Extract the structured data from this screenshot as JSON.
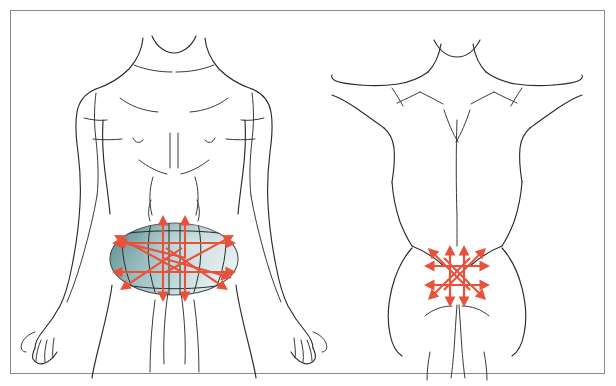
{
  "plate": {
    "title": "Abdominal and lumbosacral massage direction plate",
    "caption": "",
    "width": 616,
    "height": 386,
    "background_color": "#ffffff",
    "frame_color": "#8a8a8a",
    "frame_inset_px": 10
  },
  "colors": {
    "outline": "#2b2b2b",
    "detail": "#3a3a3a",
    "arrow": "#e8513a",
    "arrow_light": "#ef7a62",
    "ellipse_dark": "#5f8f92",
    "ellipse_mid": "#a8c8cb",
    "ellipse_light": "#e6f0f1",
    "ellipse_stroke": "#4a4a4a"
  },
  "panels": [
    {
      "id": "anterior-view",
      "name": "anterior-torso-view",
      "label": "",
      "view": "anterior",
      "region_highlight": {
        "shape": "ellipse",
        "center_x": 174,
        "center_y": 259,
        "radius_x": 64,
        "radius_y": 36,
        "fill_gradient": [
          "#5f8f92",
          "#a8c8cb",
          "#eef5f6"
        ],
        "stroke": "#4a4a4a"
      },
      "arrow_group": {
        "name": "abdominal-arrow-star",
        "center_x": 174,
        "center_y": 259,
        "arrow_count": 14,
        "color": "#e8513a",
        "arrows": [
          {
            "name": "arrow-up-left-vertical",
            "dir": "up",
            "x1": 163,
            "y1": 258,
            "x2": 163,
            "y2": 215
          },
          {
            "name": "arrow-up-right-vertical",
            "dir": "up",
            "x1": 185,
            "y1": 258,
            "x2": 185,
            "y2": 215
          },
          {
            "name": "arrow-down-left-vertical",
            "dir": "down",
            "x1": 163,
            "y1": 260,
            "x2": 163,
            "y2": 302
          },
          {
            "name": "arrow-down-right-vertical",
            "dir": "down",
            "x1": 185,
            "y1": 260,
            "x2": 185,
            "y2": 302
          },
          {
            "name": "arrow-left-upper",
            "dir": "left",
            "x1": 176,
            "y1": 243,
            "x2": 112,
            "y2": 243
          },
          {
            "name": "arrow-left-lower",
            "dir": "left",
            "x1": 176,
            "y1": 272,
            "x2": 112,
            "y2": 272
          },
          {
            "name": "arrow-right-upper",
            "dir": "right",
            "x1": 172,
            "y1": 243,
            "x2": 236,
            "y2": 243
          },
          {
            "name": "arrow-right-lower",
            "dir": "right",
            "x1": 172,
            "y1": 272,
            "x2": 236,
            "y2": 272
          },
          {
            "name": "arrow-diag-up-left",
            "dir": "up-left",
            "x1": 182,
            "y1": 272,
            "x2": 114,
            "y2": 235
          },
          {
            "name": "arrow-diag-up-right",
            "dir": "up-right",
            "x1": 166,
            "y1": 272,
            "x2": 234,
            "y2": 235
          },
          {
            "name": "arrow-diag-down-left",
            "dir": "down-left",
            "x1": 182,
            "y1": 248,
            "x2": 120,
            "y2": 290
          },
          {
            "name": "arrow-diag-down-right",
            "dir": "down-right",
            "x1": 166,
            "y1": 248,
            "x2": 228,
            "y2": 290
          },
          {
            "name": "arrow-diag-up-left-2",
            "dir": "up-left",
            "x1": 186,
            "y1": 258,
            "x2": 116,
            "y2": 241
          },
          {
            "name": "arrow-diag-down-right-2",
            "dir": "down-right",
            "x1": 162,
            "y1": 258,
            "x2": 232,
            "y2": 278
          }
        ]
      }
    },
    {
      "id": "posterior-view",
      "name": "posterior-torso-view",
      "label": "",
      "view": "posterior",
      "region_highlight": null,
      "arrow_group": {
        "name": "lumbosacral-arrow-star",
        "center_x": 457,
        "center_y": 272,
        "arrow_count": 12,
        "color": "#e8513a",
        "arrows": [
          {
            "name": "arrow-up-left-vertical",
            "dir": "up",
            "x1": 450,
            "y1": 300,
            "x2": 450,
            "y2": 245
          },
          {
            "name": "arrow-up-right-vertical",
            "dir": "up",
            "x1": 464,
            "y1": 300,
            "x2": 464,
            "y2": 245
          },
          {
            "name": "arrow-down-left-vertical",
            "dir": "down",
            "x1": 450,
            "y1": 250,
            "x2": 450,
            "y2": 307
          },
          {
            "name": "arrow-down-right-vertical",
            "dir": "down",
            "x1": 464,
            "y1": 250,
            "x2": 464,
            "y2": 307
          },
          {
            "name": "arrow-left-upper",
            "dir": "left",
            "x1": 470,
            "y1": 266,
            "x2": 424,
            "y2": 266
          },
          {
            "name": "arrow-left-lower",
            "dir": "left",
            "x1": 470,
            "y1": 285,
            "x2": 424,
            "y2": 285
          },
          {
            "name": "arrow-right-upper",
            "dir": "right",
            "x1": 444,
            "y1": 266,
            "x2": 490,
            "y2": 266
          },
          {
            "name": "arrow-right-lower",
            "dir": "right",
            "x1": 444,
            "y1": 285,
            "x2": 490,
            "y2": 285
          },
          {
            "name": "arrow-diag-up-left",
            "dir": "up-left",
            "x1": 470,
            "y1": 290,
            "x2": 428,
            "y2": 248
          },
          {
            "name": "arrow-diag-up-right",
            "dir": "up-right",
            "x1": 444,
            "y1": 290,
            "x2": 486,
            "y2": 248
          },
          {
            "name": "arrow-diag-down-left",
            "dir": "down-left",
            "x1": 470,
            "y1": 258,
            "x2": 428,
            "y2": 300
          },
          {
            "name": "arrow-diag-down-right",
            "dir": "down-right",
            "x1": 444,
            "y1": 258,
            "x2": 486,
            "y2": 300
          }
        ]
      }
    }
  ]
}
